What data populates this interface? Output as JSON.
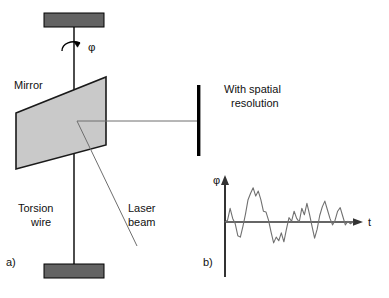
{
  "figure": {
    "caption_a": "a)",
    "caption_b": "b)",
    "background_color": "#ffffff",
    "line_color": "#000000",
    "mirror_fill": "#c9c9c9",
    "clamp_fill": "#636363",
    "beam_color": "#6e6e6e",
    "signal_color": "#707070"
  },
  "panel_a": {
    "label": "a)",
    "mirror_label": "Mirror",
    "torsion_wire_label": "Torsion\nwire",
    "torsion_wire_line1": "Torsion",
    "torsion_wire_line2": "wire",
    "laser_beam_label": "Laser\nbeam",
    "laser_beam_line1": "Laser",
    "laser_beam_line2": "beam",
    "rotation_symbol": "φ",
    "detector_label_line1": "With spatial",
    "detector_label_line2": "resolution",
    "icons": {
      "rotation_arrow": "curved-rotation-arrow-icon",
      "top_clamp": "top-clamp-icon",
      "bottom_clamp": "bottom-clamp-icon",
      "mirror_plane": "mirror-plane-icon",
      "detector_bar": "detector-bar-icon"
    }
  },
  "panel_b": {
    "label": "b)",
    "y_axis_label": "φ",
    "x_axis_label": "t"
  },
  "chart_data": {
    "type": "line",
    "title": "",
    "xlabel": "t",
    "ylabel": "φ",
    "grid": false,
    "legend": null,
    "axis_origin_px": [
      225,
      222
    ],
    "xlim": [
      0,
      1
    ],
    "ylim": [
      -1,
      1
    ],
    "series": [
      {
        "name": "angular deflection signal",
        "x": [
          0.0,
          0.02,
          0.04,
          0.06,
          0.08,
          0.1,
          0.12,
          0.14,
          0.16,
          0.18,
          0.2,
          0.22,
          0.24,
          0.26,
          0.28,
          0.3,
          0.32,
          0.34,
          0.36,
          0.38,
          0.4,
          0.42,
          0.44,
          0.46,
          0.48,
          0.5,
          0.52,
          0.54,
          0.56,
          0.58,
          0.6,
          0.62,
          0.64,
          0.66,
          0.68,
          0.7,
          0.72,
          0.74,
          0.76,
          0.78,
          0.8,
          0.82,
          0.84,
          0.86,
          0.88,
          0.9,
          0.92,
          0.94,
          0.96,
          0.98,
          1.0
        ],
        "values": [
          0.0,
          0.05,
          0.38,
          0.1,
          -0.05,
          -0.38,
          -0.42,
          -0.12,
          0.22,
          0.62,
          0.8,
          0.95,
          0.72,
          0.86,
          0.62,
          0.3,
          0.28,
          0.05,
          -0.28,
          -0.58,
          -0.42,
          -0.52,
          -0.3,
          -0.55,
          -0.2,
          0.12,
          0.02,
          0.3,
          0.1,
          0.0,
          0.38,
          0.2,
          0.52,
          0.22,
          -0.12,
          -0.45,
          -0.2,
          0.18,
          0.42,
          0.58,
          0.34,
          0.1,
          -0.08,
          0.05,
          0.3,
          0.4,
          0.16,
          -0.08,
          0.02,
          -0.05,
          0.0
        ]
      }
    ]
  }
}
